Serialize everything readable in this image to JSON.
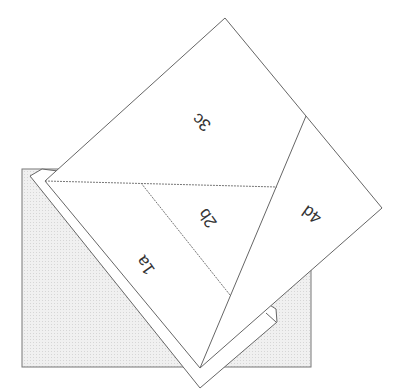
{
  "diagram": {
    "regions": [
      {
        "id": "1a",
        "label": "1a"
      },
      {
        "id": "2b",
        "label": "2b"
      },
      {
        "id": "3c",
        "label": "3c"
      },
      {
        "id": "4d",
        "label": "4d"
      }
    ],
    "colors": {
      "line": "#6e6e6e",
      "background_rect": "#eeeeee",
      "sheet": "#ffffff"
    }
  }
}
